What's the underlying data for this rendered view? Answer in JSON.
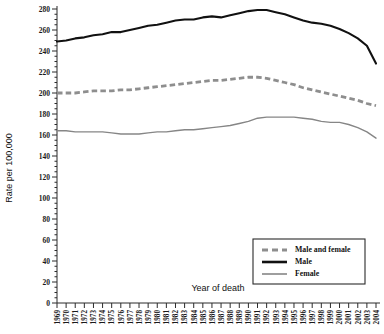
{
  "chart_data": {
    "type": "line",
    "title": "",
    "xlabel": "Year of death",
    "ylabel": "Rate per 100,000",
    "xlim": [
      1969,
      2004
    ],
    "ylim": [
      0,
      280
    ],
    "ytick_step": 20,
    "grid": false,
    "legend_position": "bottom-right",
    "x": [
      1969,
      1970,
      1971,
      1972,
      1973,
      1974,
      1975,
      1976,
      1977,
      1978,
      1979,
      1980,
      1981,
      1982,
      1983,
      1984,
      1985,
      1986,
      1987,
      1988,
      1989,
      1990,
      1991,
      1992,
      1993,
      1994,
      1995,
      1996,
      1997,
      1998,
      1999,
      2000,
      2001,
      2002,
      2003,
      2004
    ],
    "xticklabels": [
      "1969",
      "1970",
      "1971",
      "1972",
      "1973",
      "1974",
      "1975",
      "1976",
      "1977",
      "1978",
      "1979",
      "1980",
      "1981",
      "1982",
      "1983",
      "1984",
      "1985",
      "1986",
      "1987",
      "1988",
      "1989",
      "1990",
      "1991",
      "1992",
      "1993",
      "1994",
      "1995",
      "1996",
      "1997",
      "1998",
      "1999",
      "2000",
      "2001",
      "2002",
      "2003",
      "2004"
    ],
    "yticklabels": [
      "0",
      "20",
      "40",
      "60",
      "80",
      "100",
      "120",
      "140",
      "160",
      "180",
      "200",
      "220",
      "240",
      "260",
      "280"
    ],
    "yticks": [
      0,
      20,
      40,
      60,
      80,
      100,
      120,
      140,
      160,
      180,
      200,
      220,
      240,
      260,
      280
    ],
    "series": [
      {
        "name": "Male and female",
        "style": "dashed",
        "color": "#8e8e8e",
        "values": [
          200,
          200,
          200,
          201,
          202,
          202,
          202,
          203,
          203,
          204,
          205,
          206,
          207,
          208,
          209,
          210,
          211,
          212,
          212,
          213,
          214,
          215,
          215,
          214,
          212,
          210,
          208,
          205,
          203,
          201,
          199,
          197,
          195,
          193,
          190,
          188
        ]
      },
      {
        "name": "Male",
        "style": "solid-thick",
        "color": "#111111",
        "values": [
          249,
          250,
          252,
          253,
          255,
          256,
          258,
          258,
          260,
          262,
          264,
          265,
          267,
          269,
          270,
          270,
          272,
          273,
          272,
          274,
          276,
          278,
          279,
          279,
          277,
          275,
          272,
          269,
          267,
          266,
          264,
          261,
          257,
          252,
          245,
          228
        ]
      },
      {
        "name": "Female",
        "style": "solid-thin",
        "color": "#868686",
        "values": [
          164,
          164,
          163,
          163,
          163,
          163,
          162,
          161,
          161,
          161,
          162,
          163,
          163,
          164,
          165,
          165,
          166,
          167,
          168,
          169,
          171,
          173,
          176,
          177,
          177,
          177,
          177,
          176,
          175,
          173,
          172,
          172,
          170,
          167,
          163,
          157
        ]
      }
    ]
  },
  "legend": {
    "entries": [
      {
        "label": "Male and female",
        "style": "dashed"
      },
      {
        "label": "Male",
        "style": "solid-thick"
      },
      {
        "label": "Female",
        "style": "solid-thin"
      }
    ]
  }
}
